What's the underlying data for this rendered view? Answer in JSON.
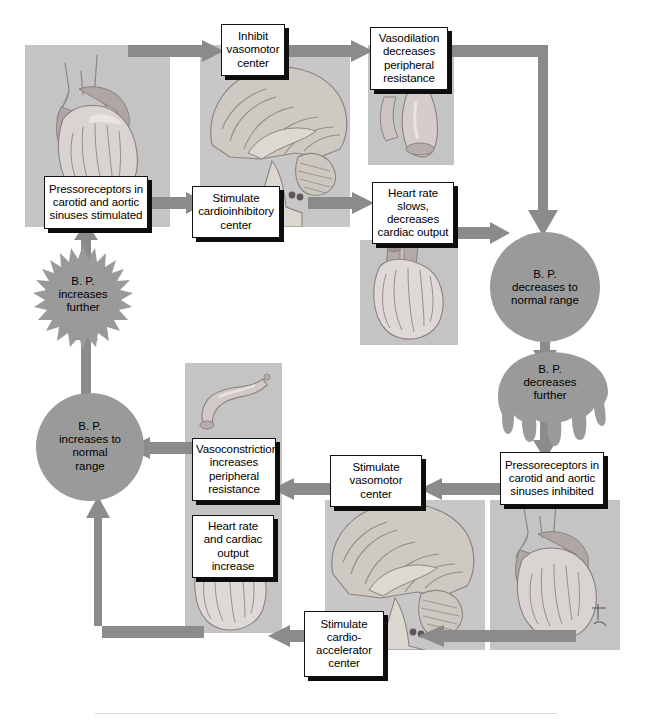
{
  "figure": {
    "palette": {
      "arrow": "#8b8b8b",
      "arrow_dark": "#7e7e7e",
      "shape_fill": "#9a9a9a",
      "panel_bg": "#c2c2c2",
      "box_bg": "#ffffff",
      "box_border": "#111111",
      "text": "#000000",
      "rule": "#d8d8d8"
    }
  },
  "upper_loop": {
    "boxes": {
      "inhibit_vasomotor": "Inhibit vasomotor center",
      "vasodilation": "Vasodilation decreases peripheral resistance",
      "pressoreceptors_stimulated": "Pressoreceptors in carotid and aortic sinuses stimulated",
      "stimulate_cardioinhibitory": "Stimulate cardioinhibitory center",
      "heart_rate_slows": "Heart rate slows, decreases cardiac output"
    },
    "states": {
      "bp_increases_further": "B. P. increases further",
      "bp_decreases_normal": "B. P. decreases to normal range",
      "bp_decreases_further": "B. P. decreases further"
    }
  },
  "lower_loop": {
    "boxes": {
      "pressoreceptors_inhibited": "Pressoreceptors in carotid and aortic sinuses inhibited",
      "stimulate_vasomotor": "Stimulate vasomotor center",
      "vasoconstriction": "Vasoconstriction increases peripheral resistance",
      "heart_rate_increase": "Heart rate and cardiac output increase",
      "stimulate_cardioaccelerator": "Stimulate cardio-accelerator center"
    },
    "states": {
      "bp_increases_normal": "B. P. increases to normal range"
    }
  },
  "box_lines": {
    "inhibit_vasomotor": [
      "Inhibit",
      "vasomotor",
      "center"
    ],
    "vasodilation": [
      "Vasodilation",
      "decreases",
      "peripheral",
      "resistance"
    ],
    "pressoreceptors_stimulated": [
      "Pressoreceptors in",
      "carotid and aortic",
      "sinuses stimulated"
    ],
    "stimulate_cardioinhibitory": [
      "Stimulate",
      "cardioinhibitory",
      "center"
    ],
    "heart_rate_slows": [
      "Heart rate",
      "slows,",
      "decreases",
      "cardiac output"
    ],
    "pressoreceptors_inhibited": [
      "Pressoreceptors in",
      "carotid and aortic",
      "sinuses inhibited"
    ],
    "stimulate_vasomotor": [
      "Stimulate",
      "vasomotor",
      "center"
    ],
    "vasoconstriction": [
      "Vasoconstriction",
      "increases",
      "peripheral",
      "resistance"
    ],
    "heart_rate_increase": [
      "Heart rate",
      "and cardiac",
      "output",
      "increase"
    ],
    "stimulate_cardioaccelerator": [
      "Stimulate",
      "cardio-",
      "accelerator",
      "center"
    ]
  },
  "state_lines": {
    "bp_increases_further": [
      "B. P.",
      "increases",
      "further"
    ],
    "bp_decreases_normal": [
      "B. P.",
      "decreases to",
      "normal range"
    ],
    "bp_decreases_further": [
      "B. P.",
      "decreases",
      "further"
    ],
    "bp_increases_normal": [
      "B. P.",
      "increases to",
      "normal",
      "range"
    ]
  },
  "illustrations": {
    "heart_top_left": "heart-illustration",
    "brain_top": "brain-sagittal-illustration",
    "vessel_dilated": "dilated-blood-vessel-illustration",
    "heart_slow": "heart-illustration",
    "vessel_constricted": "constricted-blood-vessel-illustration",
    "heart_fast": "heart-illustration",
    "brain_bottom": "brain-sagittal-illustration",
    "heart_bottom_right": "heart-illustration",
    "artist_signature": "tina-signature"
  }
}
